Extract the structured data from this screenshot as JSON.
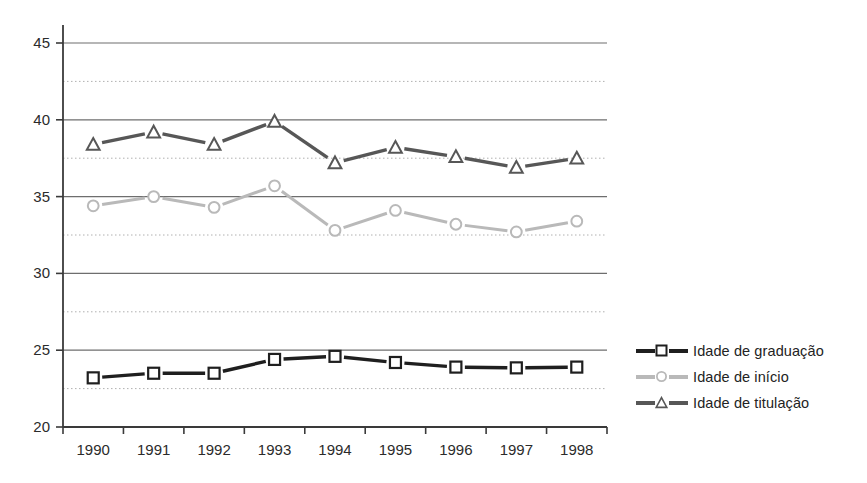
{
  "chart_data": {
    "type": "line",
    "title": "",
    "subtitle": "",
    "xlabel": "",
    "ylabel": "",
    "categories": [
      "1990",
      "1991",
      "1992",
      "1993",
      "1994",
      "1995",
      "1996",
      "1997",
      "1998"
    ],
    "x": [
      1990,
      1991,
      1992,
      1993,
      1994,
      1995,
      1996,
      1997,
      1998
    ],
    "ylim": [
      20,
      45
    ],
    "yticks": [
      20,
      25,
      30,
      35,
      40,
      45
    ],
    "ytick_labels": [
      "20",
      "25",
      "30",
      "35",
      "40",
      "45"
    ],
    "minor_gridlines": [
      22.5,
      27.5,
      32.5,
      37.5,
      42.5
    ],
    "grid": "major-solid-minor-dotted",
    "legend_position": "right",
    "series": [
      {
        "name": "Idade de graduação",
        "marker": "square",
        "color": "#1f1f1f",
        "values": [
          23.2,
          23.5,
          23.5,
          24.4,
          24.6,
          24.2,
          23.9,
          23.85,
          23.9
        ]
      },
      {
        "name": "Idade de início",
        "marker": "circle",
        "color": "#b9b9b9",
        "values": [
          34.4,
          35.0,
          34.3,
          35.7,
          32.8,
          34.1,
          33.2,
          32.7,
          33.4
        ]
      },
      {
        "name": "Idade de titulação",
        "marker": "triangle",
        "color": "#575757",
        "values": [
          38.4,
          39.2,
          38.4,
          39.9,
          37.2,
          38.2,
          37.6,
          36.9,
          37.5
        ]
      }
    ]
  },
  "legend": {
    "items": [
      {
        "label": "Idade de graduação"
      },
      {
        "label": "Idade  de início"
      },
      {
        "label": "Idade  de titulação"
      }
    ]
  },
  "colors": {
    "axis": "#3a3a3a",
    "major_grid": "#6e6e6e",
    "minor_grid": "#b0b0b0",
    "series_graduacao": "#1f1f1f",
    "series_inicio": "#b9b9b9",
    "series_titulacao": "#575757",
    "background": "#ffffff"
  }
}
